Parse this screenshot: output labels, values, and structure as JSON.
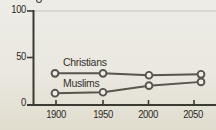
{
  "chart": {
    "y_axis_ticks": [
      "100",
      "50",
      "0"
    ],
    "x_axis_ticks": [
      "1900",
      "1950",
      "2000",
      "2050"
    ],
    "cropped_top_symbol": "partially-cropped percent/degree mark above y-axis"
  },
  "chart_data": {
    "type": "line",
    "x": [
      1900,
      1950,
      2000,
      2050
    ],
    "series": [
      {
        "name": "Christians",
        "values": [
          34,
          34,
          32,
          33
        ]
      },
      {
        "name": "Muslims",
        "values": [
          13,
          14,
          21,
          25
        ]
      }
    ],
    "title": "",
    "xlabel": "",
    "ylabel": "",
    "ylim": [
      0,
      100
    ],
    "y_ticks": [
      0,
      50,
      100
    ],
    "x_ticks": [
      1900,
      1950,
      2000,
      2050
    ],
    "grid": "single light gridline at y=100 only",
    "legend_position": "inline labels above each line, left-center of plot",
    "marker": "open-circle"
  },
  "colors": {
    "background": "#eae8e0",
    "axis": "#3b3a33",
    "gridline": "#c6c3b8",
    "line": "#57554d",
    "marker_fill": "#f0eee6",
    "text": "#2b2a24"
  }
}
